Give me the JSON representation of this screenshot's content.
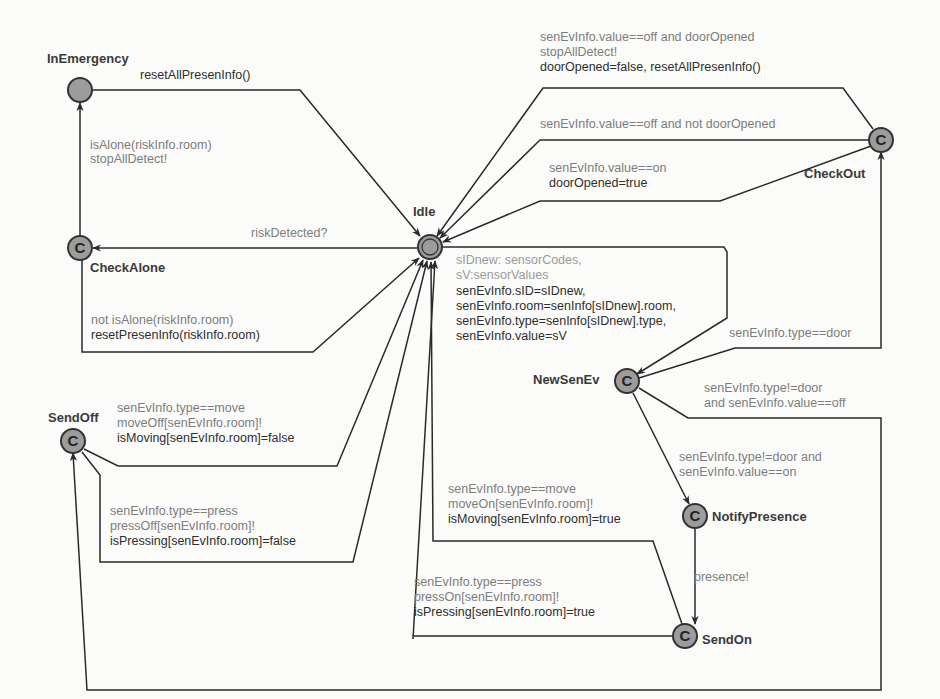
{
  "diagram": {
    "type": "UPPAAL timed automaton",
    "colors": {
      "node_fill": "#9c9c9c",
      "edge": "#2a2a2a",
      "guard_text": "#7d7d7d",
      "assign_text": "#2e2e2e"
    },
    "nodes": {
      "in_emergency": {
        "name": "InEmergency",
        "committed": false
      },
      "idle": {
        "name": "Idle",
        "initial": true
      },
      "check_alone": {
        "name": "CheckAlone",
        "committed": true,
        "glyph": "C"
      },
      "check_out": {
        "name": "CheckOut",
        "committed": true,
        "glyph": "C"
      },
      "new_sen_ev": {
        "name": "NewSenEv",
        "committed": true,
        "glyph": "C"
      },
      "notify_presence": {
        "name": "NotifyPresence",
        "committed": true,
        "glyph": "C"
      },
      "send_on": {
        "name": "SendOn",
        "committed": true,
        "glyph": "C"
      },
      "send_off": {
        "name": "SendOff",
        "committed": true,
        "glyph": "C"
      }
    },
    "edges": {
      "emergency_to_idle": {
        "from": "InEmergency",
        "to": "Idle",
        "assign": "resetAllPresenInfo()"
      },
      "checkalone_to_emergency": {
        "from": "CheckAlone",
        "to": "InEmergency",
        "guard": "isAlone(riskInfo.room)",
        "sync": "stopAllDetect!"
      },
      "idle_to_checkalone": {
        "from": "Idle",
        "to": "CheckAlone",
        "sync": "riskDetected?"
      },
      "checkalone_to_idle": {
        "from": "CheckAlone",
        "to": "Idle",
        "guard": "not isAlone(riskInfo.room)",
        "assign": "resetPresenInfo(riskInfo.room)"
      },
      "checkout_to_idle_off_opened": {
        "from": "CheckOut",
        "to": "Idle",
        "guard": "senEvInfo.value==off and doorOpened",
        "sync": "stopAllDetect!",
        "assign": "doorOpened=false, resetAllPresenInfo()"
      },
      "checkout_to_idle_off_not_opened": {
        "from": "CheckOut",
        "to": "Idle",
        "guard": "senEvInfo.value==off and not doorOpened"
      },
      "checkout_to_idle_on": {
        "from": "CheckOut",
        "to": "Idle",
        "guard": "senEvInfo.value==on",
        "assign": "doorOpened=true"
      },
      "idle_to_newsenev": {
        "from": "Idle",
        "to": "NewSenEv",
        "select_1": "sIDnew: sensorCodes,",
        "select_2": "sV:sensorValues",
        "assign_1": "senEvInfo.sID=sIDnew,",
        "assign_2": "senEvInfo.room=senInfo[sIDnew].room,",
        "assign_3": "senEvInfo.type=senInfo[sIDnew].type,",
        "assign_4": "senEvInfo.value=sV"
      },
      "newsenev_to_checkout": {
        "from": "NewSenEv",
        "to": "CheckOut",
        "guard": "senEvInfo.type==door"
      },
      "newsenev_to_sendoff": {
        "from": "NewSenEv",
        "to": "SendOff",
        "guard_1": "senEvInfo.type!=door",
        "guard_2": "and senEvInfo.value==off"
      },
      "newsenev_to_notify": {
        "from": "NewSenEv",
        "to": "NotifyPresence",
        "guard_1": "senEvInfo.type!=door and",
        "guard_2": "senEvInfo.value==on"
      },
      "notify_to_sendon": {
        "from": "NotifyPresence",
        "to": "SendOn",
        "sync": "presence!"
      },
      "sendoff_to_idle_move": {
        "from": "SendOff",
        "to": "Idle",
        "guard": "senEvInfo.type==move",
        "sync": "moveOff[senEvInfo.room]!",
        "assign": "isMoving[senEvInfo.room]=false"
      },
      "sendoff_to_idle_press": {
        "from": "SendOff",
        "to": "Idle",
        "guard": "senEvInfo.type==press",
        "sync": "pressOff[senEvInfo.room]!",
        "assign": "isPressing[senEvInfo.room]=false"
      },
      "sendon_to_idle_move": {
        "from": "SendOn",
        "to": "Idle",
        "guard": "senEvInfo.type==move",
        "sync": "moveOn[senEvInfo.room]!",
        "assign": "isMoving[senEvInfo.room]=true"
      },
      "sendon_to_idle_press": {
        "from": "SendOn",
        "to": "Idle",
        "guard": "senEvInfo.type==press",
        "sync": "pressOn[senEvInfo.room]!",
        "assign": "isPressing[senEvInfo.room]=true"
      }
    }
  }
}
